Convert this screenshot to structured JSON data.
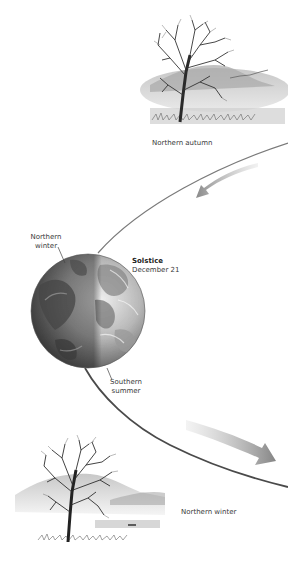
{
  "labels": {
    "northern_autumn": "Northern autumn",
    "globe_northern_winter_line1": "Northern",
    "globe_northern_winter_line2": "winter",
    "solstice_title": "Solstice",
    "solstice_date": "December 21",
    "southern_summer_line1": "Southern",
    "southern_summer_line2": "summer",
    "northern_winter_scene": "Northern winter"
  },
  "icons": {
    "upper_scene": "autumn-tree-icon",
    "lower_scene": "winter-tree-icon",
    "globe": "earth-globe-icon",
    "upper_arrow": "orbit-direction-arrow-icon",
    "lower_arrow": "orbit-direction-arrow-icon"
  },
  "colors": {
    "orbit_line": "#6a6a6a",
    "arrow_fill": "#8c8c8c",
    "text": "#3a3a3a"
  }
}
